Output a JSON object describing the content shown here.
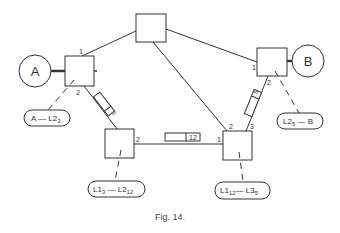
{
  "figure": {
    "caption": "Fig. 14."
  },
  "terminals": [
    {
      "id": "A",
      "label": "A"
    },
    {
      "id": "B",
      "label": "B"
    }
  ],
  "nodes": {
    "top": {
      "ports": []
    },
    "left": {
      "ports": [
        "1",
        "2"
      ]
    },
    "right": {
      "ports": [
        "1",
        "2"
      ]
    },
    "bottom_left": {
      "ports": [
        "1",
        "2"
      ]
    },
    "bottom_right": {
      "ports": [
        "1",
        "2",
        "3"
      ]
    }
  },
  "port_labels": {
    "left_1": "1",
    "left_2": "2",
    "right_1": "1",
    "right_2": "2",
    "bl_1": "1",
    "bl_2": "2",
    "br_1": "1",
    "br_2": "2",
    "br_3": "3"
  },
  "link_tags": {
    "left_to_bl": "3",
    "bl_to_br": "12",
    "right_to_br": "5"
  },
  "connection_labels": {
    "a_l2": {
      "main": "A — L2",
      "sub": "3"
    },
    "l1_l2": {
      "p1": "L1",
      "s1": "3",
      "mid": " — L2",
      "s2": "12"
    },
    "l1_l3": {
      "p1": "L1",
      "s1": "12",
      "mid": "— L3",
      "s2": "5"
    },
    "l2_b": {
      "p1": "L2",
      "s1": "5",
      "mid": " — B"
    }
  }
}
